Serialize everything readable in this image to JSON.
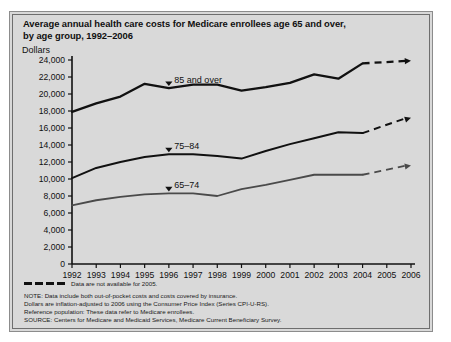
{
  "chart_data": {
    "type": "line",
    "title": "Average annual health care costs for Medicare enrollees age 65 and over, by age group, 1992–2006",
    "title_line1": "Average annual health care costs for Medicare enrollees age 65 and over,",
    "title_line2": "by age group, 1992–2006",
    "xlabel": "",
    "ylabel": "Dollars",
    "ylim": [
      0,
      24000
    ],
    "ytick_labels": [
      "24,000",
      "22,000",
      "20,000",
      "18,000",
      "16,000",
      "14,000",
      "12,000",
      "10,000",
      "8,000",
      "6,000",
      "4,000",
      "2,000",
      "0"
    ],
    "ytick_values": [
      24000,
      22000,
      20000,
      18000,
      16000,
      14000,
      12000,
      10000,
      8000,
      6000,
      4000,
      2000,
      0
    ],
    "categories": [
      1992,
      1993,
      1994,
      1995,
      1996,
      1997,
      1998,
      1999,
      2000,
      2001,
      2002,
      2003,
      2004,
      2005,
      2006
    ],
    "xtick_labels": [
      "1992",
      "1993",
      "1994",
      "1995",
      "1996",
      "1997",
      "1998",
      "1999",
      "2000",
      "2001",
      "2002",
      "2003",
      "2004",
      "2005",
      "2006"
    ],
    "grid": false,
    "legend_position": "inline-annotations",
    "missing_year": 2005,
    "missing_note": "Data are not available for 2005.",
    "series": [
      {
        "name": "85 and over",
        "label": "85 and over",
        "color": "#111111",
        "line_width": 2.3,
        "values": [
          17900,
          18900,
          19700,
          21200,
          20700,
          21100,
          21100,
          20400,
          20800,
          21300,
          22300,
          21800,
          23600,
          null,
          23900
        ],
        "dashed_from": 2004,
        "dashed_to": 2006,
        "label_x_year": 1996,
        "label_value": 21900
      },
      {
        "name": "75–84",
        "label": "75–84",
        "color": "#111111",
        "line_width": 2.0,
        "values": [
          10100,
          11300,
          12000,
          12600,
          12900,
          12900,
          12700,
          12400,
          13300,
          14100,
          14800,
          15500,
          15400,
          null,
          17200
        ],
        "dashed_from": 2004,
        "dashed_to": 2006,
        "label_x_year": 1996,
        "label_value": 13900
      },
      {
        "name": "65–74",
        "label": "65–74",
        "color": "#4a4a4a",
        "line_width": 1.8,
        "values": [
          6900,
          7500,
          7900,
          8200,
          8300,
          8300,
          8000,
          8800,
          9300,
          9900,
          10500,
          10500,
          10500,
          null,
          11600
        ],
        "dashed_from": 2004,
        "dashed_to": 2006,
        "label_x_year": 1996,
        "label_value": 9200
      }
    ],
    "notes": [
      "NOTE: Data include both out-of-pocket costs and costs covered by insurance.",
      "Dollars are inflation-adjusted to 2006 using the Consumer Price Index (Series CPI-U-RS).",
      "Reference population: These data refer to Medicare enrollees.",
      "SOURCE: Centers for Medicare and Medicaid Services, Medicare Current Beneficiary Survey."
    ]
  },
  "colors": {
    "panel_background": "#d9d9d9",
    "frame_border": "#6e6e6e",
    "axis": "#111111",
    "text": "#101010"
  }
}
